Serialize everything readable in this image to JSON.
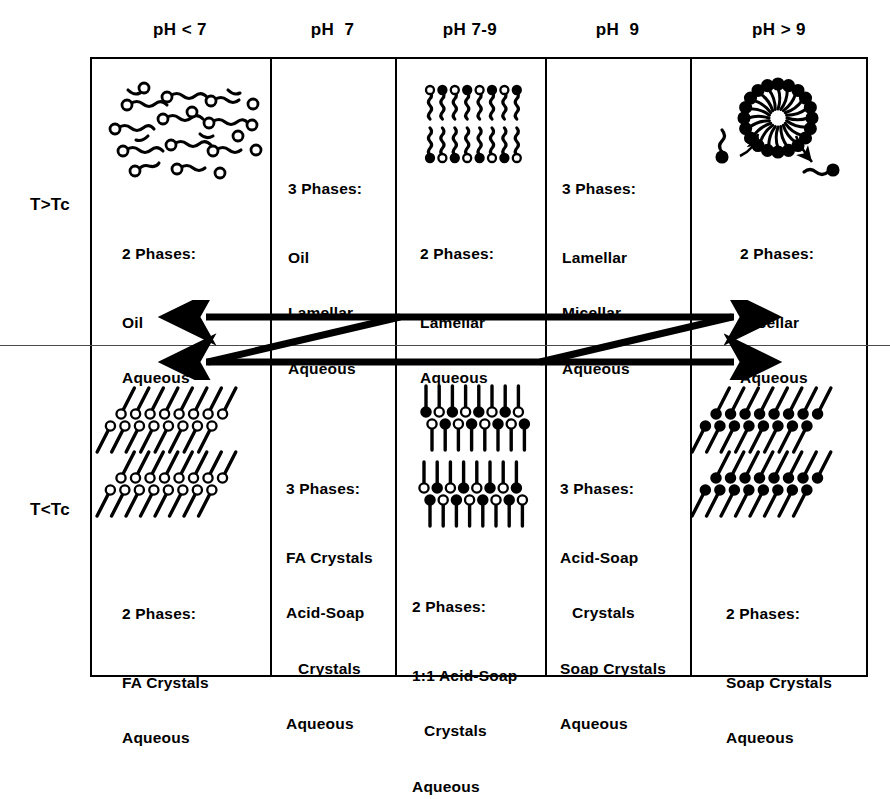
{
  "diagram": {
    "columns": [
      {
        "id": "ph-lt-7",
        "header": "pH < 7"
      },
      {
        "id": "ph-7",
        "header": "pH  7"
      },
      {
        "id": "ph-7-9",
        "header": "pH 7-9"
      },
      {
        "id": "ph-9",
        "header": "pH  9"
      },
      {
        "id": "ph-gt-9",
        "header": "pH > 9"
      }
    ],
    "rows": [
      {
        "id": "above-tc",
        "label": "T>Tc"
      },
      {
        "id": "below-tc",
        "label": "T<Tc"
      }
    ],
    "cells": {
      "above_tc": [
        {
          "phase_count": "2 Phases:",
          "phase_list": [
            "Oil",
            "Aqueous"
          ],
          "figure": "disordered-oil-chains"
        },
        {
          "phase_count": "3 Phases:",
          "phase_list": [
            "Oil",
            "Lamellar",
            "Aqueous"
          ],
          "figure": "none"
        },
        {
          "phase_count": "2 Phases:",
          "phase_list": [
            "Lamellar",
            "Aqueous"
          ],
          "figure": "lamellar-bilayer"
        },
        {
          "phase_count": "3 Phases:",
          "phase_list": [
            "Lamellar",
            "Micellar",
            "Aqueous"
          ],
          "figure": "none"
        },
        {
          "phase_count": "2 Phases:",
          "phase_list": [
            "Micellar",
            "Aqueous"
          ],
          "figure": "micelle-with-monomers"
        }
      ],
      "below_tc": [
        {
          "phase_count": "2 Phases:",
          "phase_list": [
            "FA Crystals",
            "Aqueous"
          ],
          "figure": "tilted-crystal-open-heads"
        },
        {
          "phase_count": "3 Phases:",
          "phase_list": [
            "FA Crystals",
            "Acid-Soap",
            "Crystals",
            "Aqueous"
          ],
          "indent_lines": [
            2
          ],
          "figure": "none"
        },
        {
          "phase_count": "2 Phases:",
          "phase_list": [
            "1:1 Acid-Soap",
            "Crystals",
            "Aqueous"
          ],
          "indent_lines": [
            1
          ],
          "figure": "acid-soap-crystal-vertical"
        },
        {
          "phase_count": "3 Phases:",
          "phase_list": [
            "Acid-Soap",
            "Crystals",
            "Soap Crystals",
            "Aqueous"
          ],
          "indent_lines": [
            1
          ],
          "figure": "none"
        },
        {
          "phase_count": "2 Phases:",
          "phase_list": [
            "Soap Crystals",
            "Aqueous"
          ],
          "figure": "tilted-crystal-filled-heads"
        }
      ]
    },
    "arrows": {
      "name": "phase-transition-arrows",
      "description": "Two horizontal double-headed arrows joined by two diagonal connectors spanning the temperature divider"
    },
    "colors": {
      "ink": "#000000",
      "background": "#ffffff",
      "divider": "#4a4a4a"
    }
  }
}
